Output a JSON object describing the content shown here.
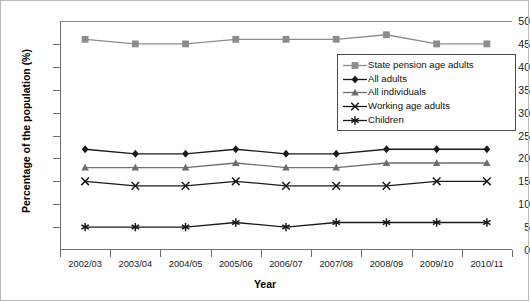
{
  "chart_data": {
    "type": "line",
    "title": "",
    "xlabel": "Year",
    "ylabel": "Percentage of the population (%)",
    "categories": [
      "2002/03",
      "2003/04",
      "2004/05",
      "2005/06",
      "2006/07",
      "2007/08",
      "2008/09",
      "2009/10",
      "2010/11"
    ],
    "ylim": [
      0,
      50
    ],
    "ytick_step": 5,
    "yticks": [
      0,
      5,
      10,
      15,
      20,
      25,
      30,
      35,
      40,
      45,
      50
    ],
    "grid": false,
    "legend_position": "inside-right-upper",
    "series": [
      {
        "name": "State pension age adults",
        "marker": "square",
        "color": "#8c8c8c",
        "values": [
          46,
          45,
          45,
          46,
          46,
          46,
          47,
          45,
          45
        ]
      },
      {
        "name": "All adults",
        "marker": "diamond",
        "color": "#1a1a1a",
        "values": [
          22,
          21,
          21,
          22,
          21,
          21,
          22,
          22,
          22
        ]
      },
      {
        "name": "All individuals",
        "marker": "triangle",
        "color": "#6e6e6e",
        "values": [
          18,
          18,
          18,
          19,
          18,
          18,
          19,
          19,
          19
        ]
      },
      {
        "name": "Working age adults",
        "marker": "cross",
        "color": "#1a1a1a",
        "values": [
          15,
          14,
          14,
          15,
          14,
          14,
          14,
          15,
          15
        ]
      },
      {
        "name": "Children",
        "marker": "asterisk",
        "color": "#1a1a1a",
        "values": [
          5,
          5,
          5,
          6,
          5,
          6,
          6,
          6,
          6
        ]
      }
    ]
  }
}
